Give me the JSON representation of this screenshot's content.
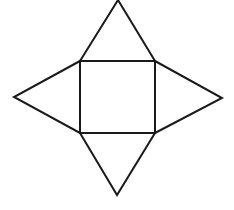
{
  "diagram": {
    "type": "pyramid-net",
    "canvas": {
      "width": 234,
      "height": 210,
      "background": "#ffffff"
    },
    "stroke": {
      "color": "#1a1a1a",
      "width": 2
    },
    "square": {
      "label": "square-base",
      "points": [
        [
          80,
          61
        ],
        [
          155,
          61
        ],
        [
          155,
          133
        ],
        [
          80,
          133
        ]
      ]
    },
    "triangles": [
      {
        "label": "triangle-top",
        "points": [
          [
            80,
            61
          ],
          [
            118,
            0
          ],
          [
            155,
            61
          ]
        ]
      },
      {
        "label": "triangle-right",
        "points": [
          [
            155,
            61
          ],
          [
            222,
            98
          ],
          [
            155,
            133
          ]
        ]
      },
      {
        "label": "triangle-bottom",
        "points": [
          [
            80,
            133
          ],
          [
            117,
            195
          ],
          [
            155,
            133
          ]
        ]
      },
      {
        "label": "triangle-left",
        "points": [
          [
            80,
            61
          ],
          [
            14,
            97
          ],
          [
            80,
            133
          ]
        ]
      }
    ]
  }
}
